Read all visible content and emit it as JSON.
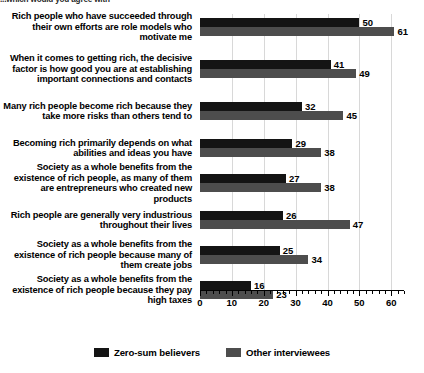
{
  "top_question": "...which would you agree with",
  "chart_data": {
    "type": "bar",
    "orientation": "horizontal",
    "title": "",
    "xlabel": "",
    "ylabel": "",
    "xlim": [
      0,
      64
    ],
    "grid": true,
    "grid_axis": "x",
    "tick_step": 10,
    "minor_tick_step": 2,
    "legend_position": "bottom",
    "xticks": [
      0,
      10,
      20,
      30,
      40,
      50,
      60
    ],
    "categories": [
      "Rich people who have succeeded through their own efforts are role models who motivate me",
      "When it comes to getting rich, the decisive factor is how good you are at establishing important connections and contacts",
      "Many rich people become rich because they take more risks than others tend to",
      "Becoming rich primarily depends on what abilities and ideas you have",
      "Society as a whole benefits from the existence of rich people, as many of them are entrepreneurs who created new products",
      "Rich people are generally very industrious throughout their lives",
      "Society as a whole benefits from the existence of rich people because many of them create jobs",
      "Society as a whole benefits from the existence of rich people because they pay high taxes"
    ],
    "series": [
      {
        "name": "Zero-sum believers",
        "color": "#141414",
        "values": [
          50,
          41,
          32,
          29,
          27,
          26,
          25,
          16
        ]
      },
      {
        "name": "Other interviewees",
        "color": "#4d4d4d",
        "values": [
          61,
          49,
          45,
          38,
          38,
          47,
          34,
          23
        ]
      }
    ]
  }
}
